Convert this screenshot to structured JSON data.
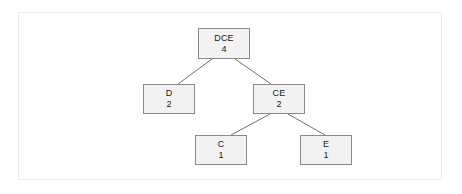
{
  "diagram": {
    "frame": {
      "border_color": "#ececec",
      "background": "#ffffff"
    },
    "style": {
      "node_fill": "#f2f2f2",
      "node_border": "#8a8a8a",
      "edge_color": "#6e6e6e",
      "text_color": "#1a1a1a"
    },
    "nodes": [
      {
        "id": "root",
        "label": "DCE",
        "weight": "4",
        "x": 198,
        "y": 28,
        "w": 52,
        "h": 31
      },
      {
        "id": "d",
        "label": "D",
        "weight": "2",
        "x": 143,
        "y": 84,
        "w": 52,
        "h": 30
      },
      {
        "id": "ce",
        "label": "CE",
        "weight": "2",
        "x": 253,
        "y": 84,
        "w": 52,
        "h": 30
      },
      {
        "id": "c",
        "label": "C",
        "weight": "1",
        "x": 195,
        "y": 135,
        "w": 52,
        "h": 30
      },
      {
        "id": "e",
        "label": "E",
        "weight": "1",
        "x": 300,
        "y": 135,
        "w": 52,
        "h": 30
      }
    ],
    "edges": [
      {
        "from": "root",
        "to": "d",
        "x1": 212,
        "y1": 59,
        "x2": 178,
        "y2": 84
      },
      {
        "from": "root",
        "to": "ce",
        "x1": 235,
        "y1": 59,
        "x2": 271,
        "y2": 84
      },
      {
        "from": "ce",
        "to": "c",
        "x1": 270,
        "y1": 114,
        "x2": 231,
        "y2": 135
      },
      {
        "from": "ce",
        "to": "e",
        "x1": 288,
        "y1": 114,
        "x2": 325,
        "y2": 135
      }
    ]
  }
}
